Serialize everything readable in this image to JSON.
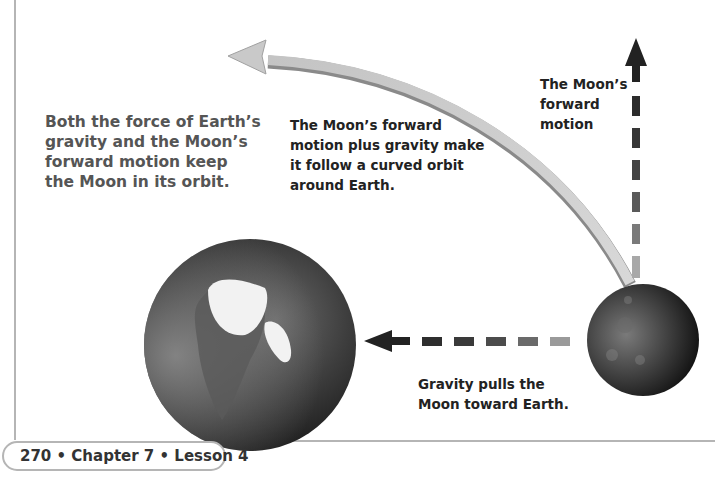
{
  "diagram": {
    "captions": {
      "main": [
        "Both the force of Earth’s",
        "gravity and the Moon’s",
        "forward motion keep",
        "the Moon in its orbit."
      ],
      "orbit": [
        "The Moon’s forward",
        "motion plus gravity make",
        "it follow a curved orbit",
        "around Earth."
      ],
      "forward_motion": [
        "The Moon’s",
        "forward",
        "motion"
      ],
      "gravity": [
        "Gravity pulls the",
        "Moon toward Earth."
      ]
    },
    "objects": {
      "earth": "Earth globe",
      "moon": "Moon"
    },
    "arrows": {
      "orbit_path": "curved orbit arrow",
      "forward_motion": "dashed upward arrow",
      "gravity": "dashed leftward arrow"
    },
    "colors": {
      "arrow_dark": "#2a2a2a",
      "arrow_light": "#b0b0b0",
      "orbit_arrow": "#c8c8c8",
      "rule": "#b5b5b5",
      "main_caption": "#555555"
    }
  },
  "footer": {
    "page_label": "270 • Chapter 7 • Lesson 4"
  }
}
